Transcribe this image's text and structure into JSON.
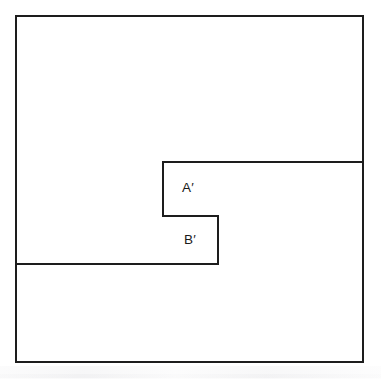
{
  "figure": {
    "background_color": "#ffffff",
    "line_color": "#1d1d1d",
    "line_width": 1.6,
    "canvas": {
      "width": 381,
      "height": 379
    },
    "outer_rectangle": {
      "name": "outer-rectangle",
      "x1": 16,
      "y1": 16,
      "x2": 363,
      "y2": 362
    },
    "paths": {
      "region_a_top": {
        "name": "region-a-top-edge",
        "description": "horizontal line forming the top of region A', running from the inner left corner to the outer right edge",
        "d": "M 163 162 L 363 162"
      },
      "region_a_left": {
        "name": "region-a-left-edge",
        "description": "vertical line forming the left side of region A'",
        "d": "M 163 162 L 163 216"
      },
      "region_a_bottom_step": {
        "name": "region-a-bottom-step",
        "description": "horizontal step separating region A' from region B'",
        "d": "M 163 216 L 218 216"
      },
      "region_b_right": {
        "name": "region-b-right-edge",
        "description": "vertical line forming the right side of region B'",
        "d": "M 218 216 L 218 264"
      },
      "region_b_bottom": {
        "name": "region-b-bottom-edge",
        "description": "horizontal line forming the bottom of region B', running to the outer left edge",
        "d": "M 16 264 L 218 264"
      }
    },
    "labels": [
      {
        "id": "label-a-prime",
        "text": "A′",
        "x": 188,
        "y": 192
      },
      {
        "id": "label-b-prime",
        "text": "B′",
        "x": 190,
        "y": 244
      }
    ]
  }
}
